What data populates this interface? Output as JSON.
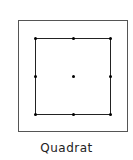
{
  "diagram": {
    "caption": "Quadrat",
    "outer_border_color": "#555555",
    "inner_border_color": "#222222",
    "sample_points": [
      {
        "pos": "top-left"
      },
      {
        "pos": "top-center"
      },
      {
        "pos": "top-right"
      },
      {
        "pos": "middle-left"
      },
      {
        "pos": "center"
      },
      {
        "pos": "middle-right"
      },
      {
        "pos": "bottom-left"
      },
      {
        "pos": "bottom-center"
      },
      {
        "pos": "bottom-right"
      }
    ]
  }
}
